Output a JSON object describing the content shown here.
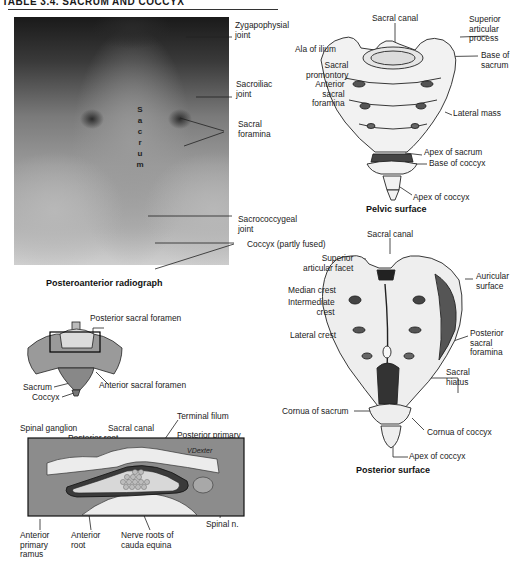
{
  "header": {
    "title": "TABLE 3.4.  SACRUM AND COCCYX"
  },
  "radiograph": {
    "caption": "Posteroanterior radiograph",
    "overlay_letters": [
      "S",
      "a",
      "c",
      "r",
      "u",
      "m"
    ],
    "labels": {
      "zygapophysial": "Zygapophysial\njoint",
      "sacroiliac": "Sacroiliac\njoint",
      "sacral_foramina": "Sacral\nforamina",
      "sacrococcygeal": "Sacrococcygeal\njoint",
      "coccyx": "Coccyx (partly fused)"
    }
  },
  "pelvic": {
    "caption": "Pelvic surface",
    "labels": {
      "sacral_canal": "Sacral canal",
      "superior_articular": "Superior\narticular\nprocess",
      "ala": "Ala of ilium",
      "base_sacrum": "Base of\nsacrum",
      "promontory": "Sacral\npromontory",
      "anterior_foramina": "Anterior\nsacral\nforamina",
      "lateral_mass": "Lateral mass",
      "apex_sacrum": "Apex of sacrum",
      "base_coccyx": "Base of coccyx",
      "apex_coccyx": "Apex of coccyx"
    }
  },
  "posterior": {
    "caption": "Posterior surface",
    "labels": {
      "sacral_canal": "Sacral canal",
      "superior_facet": "Superior\narticular facet",
      "auricular": "Auricular\nsurface",
      "median_crest": "Median crest",
      "intermediate_crest": "Intermediate\ncrest",
      "lateral_crest": "Lateral crest",
      "posterior_foramina": "Posterior\nsacral\nforamina",
      "sacral_hiatus": "Sacral\nhiatus",
      "cornua_sacrum": "Cornua of sacrum",
      "cornua_coccyx": "Cornua of coccyx",
      "apex_coccyx": "Apex of coccyx"
    }
  },
  "section": {
    "labels": {
      "posterior_foramen": "Posterior sacral foramen",
      "sacrum": "Sacrum",
      "coccyx": "Coccyx",
      "anterior_foramen": "Anterior sacral foramen",
      "terminal_filum": "Terminal filum",
      "spinal_ganglion": "Spinal ganglion",
      "sacral_canal": "Sacral canal",
      "posterior_root": "Posterior root",
      "posterior_ramus": "Posterior primary\nramus",
      "anterior_ramus": "Anterior\nprimary\nramus",
      "anterior_root": "Anterior\nroot",
      "nerve_roots": "Nerve roots of\ncauda equina",
      "spinal_n": "Spinal n.",
      "signature": "VDexter"
    }
  }
}
